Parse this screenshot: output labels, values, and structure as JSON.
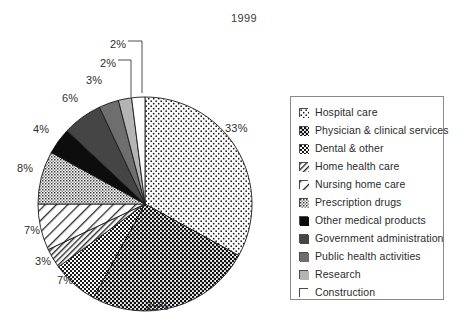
{
  "chart_data": {
    "type": "pie",
    "title": "1999",
    "xlabel": "",
    "ylabel": "",
    "legend_position": "right",
    "grid": false,
    "units": "percent",
    "start_angle_deg": 90,
    "direction": "clockwise",
    "categories": [
      "Hospital care",
      "Physician & clinical services",
      "Dental & other",
      "Home health care",
      "Nursing home care",
      "Prescription drugs",
      "Other medical products",
      "Government administration",
      "Public health activities",
      "Research",
      "Construction"
    ],
    "values": [
      33,
      25,
      7,
      3,
      7,
      8,
      4,
      6,
      3,
      2,
      2
    ],
    "labels": [
      "33%",
      "25%",
      "7%",
      "3%",
      "7%",
      "8%",
      "4%",
      "6%",
      "3%",
      "2%",
      "2%"
    ],
    "fills": [
      "dots-sparse",
      "dots-dense",
      "checker",
      "diagonal-fine",
      "diagonal-wide",
      "crosshatch-gray",
      "solid-black",
      "solid-darkgray",
      "solid-gray",
      "solid-lightgray",
      "solid-white"
    ],
    "slices": [
      {
        "name": "Hospital care",
        "value": 33,
        "label": "33%",
        "fill": "dots-sparse"
      },
      {
        "name": "Physician & clinical services",
        "value": 25,
        "label": "25%",
        "fill": "dots-dense"
      },
      {
        "name": "Dental & other",
        "value": 7,
        "label": "7%",
        "fill": "checker"
      },
      {
        "name": "Home health care",
        "value": 3,
        "label": "3%",
        "fill": "diagonal-fine"
      },
      {
        "name": "Nursing home care",
        "value": 7,
        "label": "7%",
        "fill": "diagonal-wide"
      },
      {
        "name": "Prescription drugs",
        "value": 8,
        "label": "8%",
        "fill": "crosshatch-gray"
      },
      {
        "name": "Other medical products",
        "value": 4,
        "label": "4%",
        "fill": "solid-black"
      },
      {
        "name": "Government administration",
        "value": 6,
        "label": "6%",
        "fill": "solid-darkgray"
      },
      {
        "name": "Public health activities",
        "value": 3,
        "label": "3%",
        "fill": "solid-gray"
      },
      {
        "name": "Research",
        "value": 2,
        "label": "2%",
        "fill": "solid-lightgray"
      },
      {
        "name": "Construction",
        "value": 2,
        "label": "2%",
        "fill": "solid-white"
      }
    ]
  },
  "title": {
    "text": "1999"
  },
  "legend": {
    "items": [
      {
        "label": "Hospital care",
        "swatch": "dots-sparse"
      },
      {
        "label": "Physician & clinical services",
        "swatch": "dots-dense"
      },
      {
        "label": "Dental & other",
        "swatch": "checker"
      },
      {
        "label": "Home health care",
        "swatch": "diagonal-fine"
      },
      {
        "label": "Nursing home care",
        "swatch": "diagonal-wide"
      },
      {
        "label": "Prescription drugs",
        "swatch": "crosshatch-gray"
      },
      {
        "label": "Other medical products",
        "swatch": "solid-black"
      },
      {
        "label": "Government administration",
        "swatch": "solid-darkgray"
      },
      {
        "label": "Public health activities",
        "swatch": "solid-gray"
      },
      {
        "label": "Research",
        "swatch": "solid-lightgray"
      },
      {
        "label": "Construction",
        "swatch": "solid-white"
      }
    ]
  },
  "slice_labels": [
    {
      "text": "33%",
      "left": 225,
      "top": 122
    },
    {
      "text": "25%",
      "left": 146,
      "top": 300
    },
    {
      "text": "7%",
      "left": 57,
      "top": 274
    },
    {
      "text": "3%",
      "left": 35,
      "top": 255
    },
    {
      "text": "7%",
      "left": 24,
      "top": 224
    },
    {
      "text": "8%",
      "left": 17,
      "top": 162
    },
    {
      "text": "4%",
      "left": 33,
      "top": 123
    },
    {
      "text": "6%",
      "left": 62,
      "top": 92
    },
    {
      "text": "3%",
      "left": 86,
      "top": 74
    },
    {
      "text": "2%",
      "left": 100,
      "top": 57
    },
    {
      "text": "2%",
      "left": 110,
      "top": 38
    }
  ],
  "colors": {
    "ink": "#222222",
    "black": "#0d0d0d",
    "darkgray": "#454545",
    "gray": "#6e6e6e",
    "lightgray": "#b4b4b4",
    "white": "#ffffff",
    "outline": "#1a1a1a",
    "legend_border": "#8a8a8a"
  }
}
